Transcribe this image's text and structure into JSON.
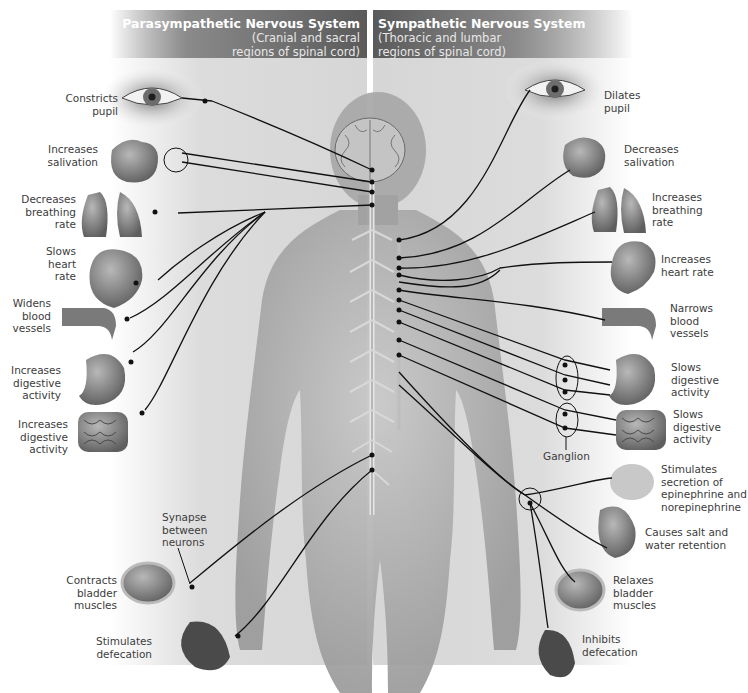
{
  "figure": {
    "left_system": {
      "title": "Parasympathetic Nervous System",
      "subtitle_line1": "(Cranial and sacral",
      "subtitle_line2": "regions of spinal cord)"
    },
    "right_system": {
      "title": "Sympathetic Nervous System",
      "subtitle_line1": "(Thoracic and lumbar",
      "subtitle_line2": "regions of spinal cord)"
    },
    "parasympathetic_effects": [
      {
        "organ": "eye",
        "lines": [
          "Constricts",
          "pupil"
        ]
      },
      {
        "organ": "salivary-glands",
        "lines": [
          "Increases",
          "salivation"
        ]
      },
      {
        "organ": "lungs",
        "lines": [
          "Decreases",
          "breathing",
          "rate"
        ]
      },
      {
        "organ": "heart",
        "lines": [
          "Slows",
          "heart",
          "rate"
        ]
      },
      {
        "organ": "blood-vessel",
        "lines": [
          "Widens",
          "blood",
          "vessels"
        ]
      },
      {
        "organ": "stomach",
        "lines": [
          "Increases",
          "digestive",
          "activity"
        ]
      },
      {
        "organ": "intestines",
        "lines": [
          "Increases",
          "digestive",
          "activity"
        ]
      },
      {
        "organ": "bladder",
        "lines": [
          "Contracts",
          "bladder",
          "muscles"
        ]
      },
      {
        "organ": "rectum",
        "lines": [
          "Stimulates",
          "defecation"
        ]
      }
    ],
    "sympathetic_effects": [
      {
        "organ": "eye",
        "lines": [
          "Dilates",
          "pupil"
        ]
      },
      {
        "organ": "salivary-glands",
        "lines": [
          "Decreases",
          "salivation"
        ]
      },
      {
        "organ": "lungs",
        "lines": [
          "Increases",
          "breathing",
          "rate"
        ]
      },
      {
        "organ": "heart",
        "lines": [
          "Increases",
          "heart rate"
        ]
      },
      {
        "organ": "blood-vessel",
        "lines": [
          "Narrows",
          "blood",
          "vessels"
        ]
      },
      {
        "organ": "stomach",
        "lines": [
          "Slows",
          "digestive",
          "activity"
        ]
      },
      {
        "organ": "intestines",
        "lines": [
          "Slows",
          "digestive",
          "activity"
        ]
      },
      {
        "organ": "adrenal-gland",
        "lines": [
          "Stimulates",
          "secretion of",
          "epinephrine and",
          "norepinephrine"
        ]
      },
      {
        "organ": "kidney",
        "lines": [
          "Causes salt and",
          "water retention"
        ]
      },
      {
        "organ": "bladder",
        "lines": [
          "Relaxes",
          "bladder",
          "muscles"
        ]
      },
      {
        "organ": "rectum",
        "lines": [
          "Inhibits",
          "defecation"
        ]
      }
    ],
    "annotations": {
      "synapse": [
        "Synapse",
        "between",
        "neurons"
      ],
      "ganglion": "Ganglion"
    },
    "colors": {
      "header_dark": "#5a5a5a",
      "panel_bg": "#d8d8d8",
      "nerve_line": "#111111",
      "label_text": "#3c3c3c"
    }
  }
}
